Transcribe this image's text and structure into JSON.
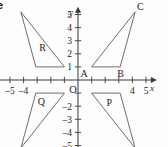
{
  "figure": {
    "badge": "e",
    "background_color": "#fdfdfd",
    "axis_color": "#3a3a3a",
    "shape_color": "#6e6e6e",
    "text_color": "#1d1d1d"
  },
  "chart_data": {
    "type": "scatter",
    "title": "",
    "xlabel": "x",
    "ylabel": "y",
    "xlim": [
      -5.8,
      5.8
    ],
    "ylim": [
      -5.6,
      5.6
    ],
    "grid": false,
    "legend": "none",
    "x_ticks": [
      -5,
      -4,
      -3,
      -2,
      -1,
      1,
      2,
      3,
      4,
      5
    ],
    "y_ticks": [
      -5,
      -4,
      -3,
      -2,
      -1,
      1,
      2,
      3,
      4,
      5
    ],
    "x_tick_labels_shown": [
      "-5",
      "-4",
      "4",
      "5"
    ],
    "y_tick_labels_shown": [
      "5",
      "4",
      "3",
      "2",
      "1",
      "-2",
      "-3",
      "-4",
      "-5"
    ],
    "origin_label": "O",
    "series": [
      {
        "name": "R",
        "label": "R",
        "label_point": [
          -2.6,
          2.2
        ],
        "quadrant": "II",
        "closed": true,
        "points": [
          [
            -4.2,
            5.2
          ],
          [
            -3.1,
            1.0
          ],
          [
            -1.0,
            1.0
          ]
        ]
      },
      {
        "name": "ABC",
        "label": "",
        "label_point": null,
        "quadrant": "I",
        "closed": true,
        "points": [
          [
            1.0,
            1.0
          ],
          [
            3.1,
            1.0
          ],
          [
            4.2,
            5.2
          ]
        ],
        "vertex_labels": [
          {
            "text": "A",
            "point": [
              1.0,
              1.0
            ],
            "dx": -11,
            "dy": 10
          },
          {
            "text": "B",
            "point": [
              3.1,
              1.0
            ],
            "dx": -3,
            "dy": 10
          },
          {
            "text": "C",
            "point": [
              4.2,
              5.2
            ],
            "dx": 2,
            "dy": -2
          }
        ]
      },
      {
        "name": "Q",
        "label": "Q",
        "label_point": [
          -2.7,
          -1.9
        ],
        "quadrant": "III",
        "closed": true,
        "points": [
          [
            -3.1,
            -1.0
          ],
          [
            -1.0,
            -1.0
          ],
          [
            -4.2,
            -5.2
          ]
        ]
      },
      {
        "name": "P",
        "label": "P",
        "label_point": [
          2.3,
          -2.0
        ],
        "quadrant": "IV",
        "closed": true,
        "points": [
          [
            1.0,
            -1.0
          ],
          [
            3.1,
            -1.0
          ],
          [
            4.2,
            -5.2
          ]
        ]
      }
    ],
    "x_tick_label_positions": [
      {
        "text": "-5",
        "value": -5
      },
      {
        "text": "-4",
        "value": -4
      },
      {
        "text": "4",
        "value": 4
      },
      {
        "text": "5",
        "value": 5
      }
    ],
    "y_tick_label_positions": [
      {
        "text": "5",
        "value": 5
      },
      {
        "text": "4",
        "value": 4
      },
      {
        "text": "3",
        "value": 3
      },
      {
        "text": "2",
        "value": 2
      },
      {
        "text": "1",
        "value": 1
      },
      {
        "text": "-2",
        "value": -2
      },
      {
        "text": "-3",
        "value": -3
      },
      {
        "text": "-4",
        "value": -4
      },
      {
        "text": "-5",
        "value": -5
      }
    ]
  }
}
